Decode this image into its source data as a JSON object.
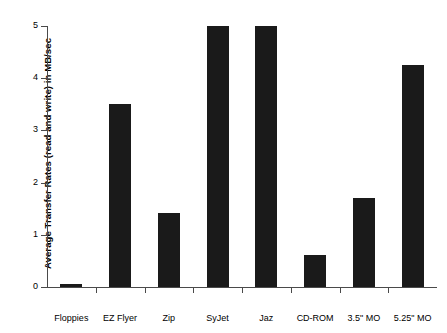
{
  "chart_data": {
    "type": "bar",
    "title": "",
    "xlabel": "",
    "ylabel": "Average Transfer Rates (read and write) in MB/sec",
    "categories": [
      "Floppies",
      "EZ Flyer",
      "Zip",
      "SyJet",
      "Jaz",
      "CD-ROM",
      "3.5\" MO",
      "5.25\" MO"
    ],
    "values": [
      0.05,
      3.5,
      1.42,
      5.0,
      5.0,
      0.62,
      1.7,
      4.25
    ],
    "series": [
      {
        "name": "Average Transfer Rates (read and write) in MB/sec",
        "values": [
          0.05,
          3.5,
          1.42,
          5.0,
          5.0,
          0.62,
          1.7,
          4.25
        ]
      }
    ],
    "ylim": [
      0,
      5
    ],
    "yticks": [
      0,
      1,
      2,
      3,
      4,
      5
    ],
    "ytick_labels": [
      "0",
      "1",
      "2",
      "3",
      "4",
      "5"
    ],
    "grid": false,
    "legend": false,
    "bar_color": "#1a1a1a",
    "axis_color": "#4a4a4a",
    "background": "#ffffff"
  }
}
